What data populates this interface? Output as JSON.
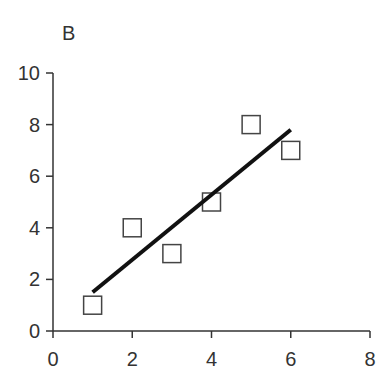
{
  "panel_label": "B",
  "chart_data": {
    "type": "scatter",
    "title": "B",
    "xlabel": "",
    "ylabel": "",
    "xlim": [
      0,
      8
    ],
    "ylim": [
      0,
      10
    ],
    "xticks": [
      0,
      2,
      4,
      6,
      8
    ],
    "yticks": [
      0,
      2,
      4,
      6,
      8,
      10
    ],
    "grid": false,
    "legend": null,
    "series": [
      {
        "name": "observations",
        "marker": "open-square",
        "x": [
          1,
          2,
          3,
          4,
          5,
          6
        ],
        "y": [
          1,
          4,
          3,
          5,
          8,
          7
        ]
      },
      {
        "name": "fit-line",
        "type": "line",
        "x": [
          1,
          6
        ],
        "y": [
          1.5,
          7.8
        ]
      }
    ]
  },
  "colors": {
    "axis": "#333333",
    "marker_stroke": "#444444",
    "line": "#111111"
  }
}
